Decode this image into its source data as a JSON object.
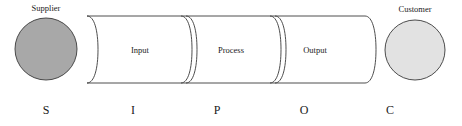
{
  "diagram": {
    "type": "sipoc-process-diagram",
    "background_color": "#ffffff",
    "stroke_color": "#3a3a3a",
    "nodes": [
      {
        "id": "supplier",
        "label": "Supplier",
        "letter": "S",
        "shape": "circle",
        "fill_color": "#a8a8a8",
        "cx": 46,
        "cy": 49,
        "r": 31,
        "label_x": 46,
        "label_y": 11,
        "letter_x": 46,
        "letter_y": 114
      },
      {
        "id": "customer",
        "label": "Customer",
        "letter": "C",
        "shape": "circle",
        "fill_color": "#e2e2e2",
        "cx": 415,
        "cy": 50,
        "r": 30,
        "label_x": 415,
        "label_y": 12,
        "letter_x": 390,
        "letter_y": 114
      }
    ],
    "pipeline": {
      "x_start": 87,
      "x_end": 365,
      "y_top": 16,
      "y_bottom": 83,
      "cap_depth": 11,
      "segments": [
        {
          "id": "input",
          "label": "Input",
          "letter": "I",
          "label_x": 140,
          "label_y": 53,
          "letter_x": 133,
          "letter_y": 114,
          "divider_x": 186
        },
        {
          "id": "process",
          "label": "Process",
          "letter": "P",
          "label_x": 231,
          "label_y": 53,
          "letter_x": 217,
          "letter_y": 114,
          "divider_x": 275
        },
        {
          "id": "output",
          "label": "Output",
          "letter": "O",
          "label_x": 315,
          "label_y": 53,
          "letter_x": 304,
          "letter_y": 114,
          "divider_x": null
        }
      ]
    },
    "acronym_row": {
      "letters": [
        "S",
        "I",
        "P",
        "O",
        "C"
      ],
      "baseline_y": 114
    }
  }
}
